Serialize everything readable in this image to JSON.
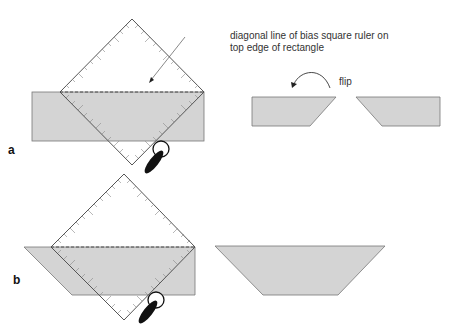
{
  "annotation": {
    "line1": "diagonal line of bias square ruler on",
    "line2": "top edge of rectangle"
  },
  "flip_label": "flip",
  "panels": [
    {
      "label": "a"
    },
    {
      "label": "b"
    }
  ],
  "colors": {
    "fabric_fill": "#d4d4d4",
    "outline": "#666666",
    "ruler_outline": "#555555",
    "cutter": "#111111"
  }
}
